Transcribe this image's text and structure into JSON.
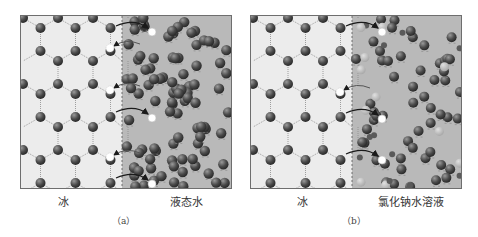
{
  "figure": {
    "panels": [
      {
        "id": "a",
        "caption": "（a）",
        "left_label": "冰",
        "right_label": "液态水",
        "has_ions": false
      },
      {
        "id": "b",
        "caption": "（b）",
        "left_label": "冰",
        "right_label": "氯化钠水溶液",
        "has_ions": true
      }
    ],
    "colors": {
      "ice_bg": "#ececec",
      "liquid_bg": "#b9b9b9",
      "molecule": "#4a4a4a",
      "ion": "#a9a9a9",
      "bond": "#8a8a8a",
      "arrow": "#1a1a1a",
      "leaving_molecule": "#ffffff",
      "border": "#6e6e6e"
    },
    "arrows_a": [
      {
        "dir": "out",
        "y": 6
      },
      {
        "dir": "in",
        "y": 28
      },
      {
        "dir": "in",
        "y": 70
      },
      {
        "dir": "out",
        "y": 92
      },
      {
        "dir": "in",
        "y": 137
      },
      {
        "dir": "out",
        "y": 158
      }
    ],
    "arrows_b": [
      {
        "dir": "out",
        "y": 6
      },
      {
        "dir": "in",
        "y": 72
      },
      {
        "dir": "out",
        "y": 93
      },
      {
        "dir": "out",
        "y": 134
      }
    ]
  }
}
